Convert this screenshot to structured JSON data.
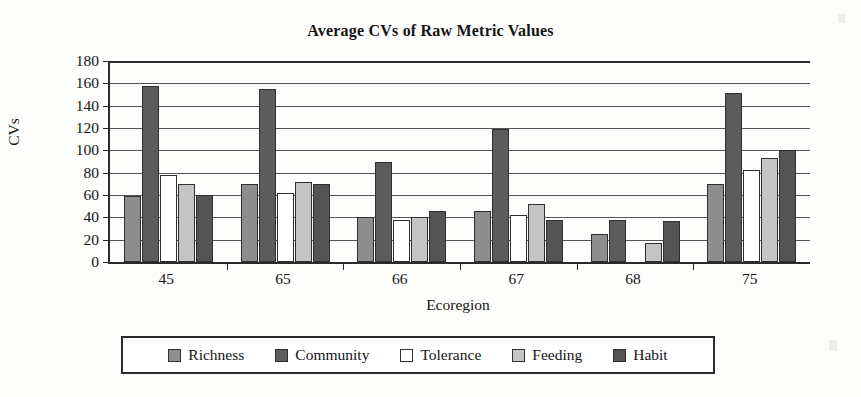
{
  "chart_data": {
    "type": "bar",
    "title": "Average CVs of Raw Metric Values",
    "xlabel": "Ecoregion",
    "ylabel": "CVs",
    "categories": [
      "45",
      "65",
      "66",
      "67",
      "68",
      "75"
    ],
    "ylim": [
      0,
      180
    ],
    "yticks": [
      0,
      20,
      40,
      60,
      80,
      100,
      120,
      140,
      160,
      180
    ],
    "grid": true,
    "legend_position": "bottom",
    "series": [
      {
        "name": "Richness",
        "color": "#8e8e8e",
        "values": [
          59,
          70,
          40,
          46,
          25,
          70
        ]
      },
      {
        "name": "Community",
        "color": "#5c5c5c",
        "values": [
          158,
          155,
          90,
          119,
          38,
          151
        ]
      },
      {
        "name": "Tolerance",
        "color": "#ffffff",
        "values": [
          78,
          62,
          38,
          42,
          0,
          82
        ]
      },
      {
        "name": "Feeding",
        "color": "#c4c4c4",
        "values": [
          70,
          72,
          40,
          52,
          17,
          93
        ]
      },
      {
        "name": "Habit",
        "color": "#545454",
        "values": [
          60,
          70,
          46,
          38,
          37,
          100
        ]
      }
    ]
  }
}
